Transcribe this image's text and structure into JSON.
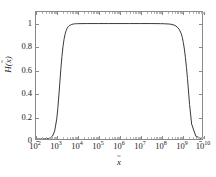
{
  "figure": {
    "background_color": "#ffffff",
    "frame_color": "#8a8a8a",
    "curve_color": "#3a3a3a"
  },
  "axes": {
    "x": {
      "label_base": "x",
      "label_accent": "tilde",
      "scale": "log",
      "min": 100,
      "max": 10000000000,
      "exponent_min": 2,
      "exponent_max": 10,
      "tick_labels": [
        "10^2",
        "10^3",
        "10^4",
        "10^5",
        "10^6",
        "10^7",
        "10^8",
        "10^9",
        "10^10"
      ],
      "tick_mantissas": [
        "10",
        "10",
        "10",
        "10",
        "10",
        "10",
        "10",
        "10",
        "10"
      ],
      "tick_exponents": [
        "2",
        "3",
        "4",
        "5",
        "6",
        "7",
        "8",
        "9",
        "10"
      ]
    },
    "y": {
      "label_function": "H",
      "label_arg_base": "x",
      "label_arg_accent": "tilde",
      "scale": "linear",
      "min": 0,
      "max": 1.1,
      "tick_values": [
        0,
        0.2,
        0.4,
        0.6,
        0.8,
        1
      ],
      "tick_labels": [
        "0",
        "0.2",
        "0.4",
        "0.6",
        "0.8",
        "1"
      ]
    }
  },
  "chart_data": {
    "type": "line",
    "title": "",
    "subtitle": "",
    "xlabel": "x~",
    "ylabel": "H(x~)",
    "xscale": "log",
    "yscale": "linear",
    "xlim": [
      100,
      10000000000
    ],
    "ylim": [
      0,
      1.1
    ],
    "grid": false,
    "legend": null,
    "legend_position": "none",
    "annotations": [],
    "series": [
      {
        "name": "H(x~)",
        "color": "#3a3a3a",
        "line_width": 1,
        "x": [
          100,
          158.49,
          251.19,
          398.11,
          501.19,
          630.96,
          794.33,
          1000,
          1122,
          1258.9,
          1412.5,
          1584.9,
          1778.3,
          1995.3,
          2238.7,
          2511.9,
          2818.4,
          3162.3,
          3548.1,
          3981.1,
          5011.9,
          6309.6,
          7943.3,
          10000,
          31622.8,
          100000,
          316228,
          1000000,
          3162280,
          10000000,
          31622800,
          100000000,
          158489000,
          251189000,
          316228000,
          398107000,
          501187000,
          630957000,
          794328000,
          1000000000,
          1122018000,
          1258925000,
          1412538000,
          1584893000,
          1778279000,
          1995262000,
          2511886000,
          3162278000,
          5011872000,
          10000000000
        ],
        "y": [
          0.0,
          0.0,
          0.001,
          0.004,
          0.01,
          0.026,
          0.07,
          0.175,
          0.262,
          0.372,
          0.492,
          0.611,
          0.715,
          0.799,
          0.862,
          0.907,
          0.938,
          0.959,
          0.972,
          0.981,
          0.991,
          0.996,
          0.998,
          0.999,
          1.0,
          1.0,
          1.0,
          1.0,
          1.0,
          1.0,
          1.0,
          0.999,
          0.998,
          0.996,
          0.994,
          0.99,
          0.983,
          0.971,
          0.95,
          0.912,
          0.88,
          0.836,
          0.779,
          0.707,
          0.621,
          0.525,
          0.3,
          0.13,
          0.025,
          0.0
        ]
      }
    ]
  }
}
